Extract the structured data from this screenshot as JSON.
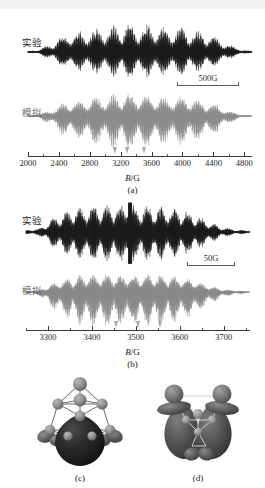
{
  "figure": {
    "type": "scientific-figure"
  },
  "panel_a": {
    "tag": "(a)",
    "axis_title_symbol": "B",
    "axis_title_unit": "/G",
    "traces": [
      {
        "key": "experiment",
        "label": "实验",
        "color": "#1c1c1c"
      },
      {
        "key": "simulation",
        "label": "模拟",
        "color": "#8a8a8a"
      }
    ],
    "scalebar": {
      "label": "500G"
    },
    "axis": {
      "min": 2000,
      "max": 4900,
      "ticks": [
        2000,
        2400,
        2800,
        3200,
        3600,
        4000,
        4400,
        4800
      ],
      "tick_labels": [
        "2000",
        "2400",
        "2800",
        "3200",
        "3600",
        "4000",
        "4400",
        "4800"
      ],
      "minor_step": 200
    },
    "markers": [
      3120,
      3280,
      3500
    ]
  },
  "panel_b": {
    "tag": "(b)",
    "axis_title_symbol": "B",
    "axis_title_unit": "/G",
    "traces": [
      {
        "key": "experiment",
        "label": "实验",
        "color": "#1c1c1c"
      },
      {
        "key": "simulation",
        "label": "模拟",
        "color": "#8a8a8a"
      }
    ],
    "scalebar": {
      "label": "50G"
    },
    "axis": {
      "min": 3250,
      "max": 3760,
      "ticks": [
        3300,
        3400,
        3500,
        3600,
        3700
      ],
      "tick_labels": [
        "3300",
        "3400",
        "3500",
        "3600",
        "3700"
      ],
      "minor_step": 50
    },
    "markers": [
      3455,
      3505,
      3555
    ]
  },
  "panel_c": {
    "tag": "(c)",
    "caption_note": "molecular orbital isosurface"
  },
  "panel_d": {
    "tag": "(d)",
    "caption_note": "molecular orbital isosurface"
  },
  "chart_data": {
    "type": "line",
    "title": "",
    "xlabel": "B/G",
    "ylabel": "",
    "charts": [
      {
        "name": "panel_a",
        "xlim": [
          2000,
          4900
        ],
        "xticks": [
          2000,
          2400,
          2800,
          3200,
          3600,
          4000,
          4400,
          4800
        ],
        "series": [
          {
            "name": "实验",
            "comment": "experimental EPR derivative spectrum, dense hyperfine envelope",
            "envelope_x": [
              2000,
              2150,
              2300,
              2420,
              2560,
              2700,
              2840,
              2980,
              3120,
              3250,
              3400,
              3520,
              3660,
              3800,
              3940,
              4080,
              4220,
              4360,
              4500,
              4640,
              4780,
              4900
            ],
            "envelope_y": [
              0.04,
              0.1,
              0.3,
              0.56,
              0.7,
              0.74,
              0.82,
              0.88,
              0.96,
              1.0,
              0.92,
              0.96,
              0.88,
              0.84,
              0.9,
              0.8,
              0.72,
              0.62,
              0.44,
              0.22,
              0.08,
              0.03
            ]
          },
          {
            "name": "模拟",
            "comment": "simulated EPR derivative spectrum",
            "envelope_x": [
              2000,
              2150,
              2300,
              2420,
              2560,
              2700,
              2840,
              2980,
              3120,
              3250,
              3400,
              3520,
              3660,
              3800,
              3940,
              4080,
              4220,
              4360,
              4500,
              4640,
              4780,
              4900
            ],
            "envelope_y": [
              0.03,
              0.08,
              0.26,
              0.52,
              0.66,
              0.7,
              0.78,
              0.84,
              0.92,
              0.98,
              0.88,
              0.94,
              0.84,
              0.8,
              0.86,
              0.76,
              0.68,
              0.56,
              0.4,
              0.18,
              0.06,
              0.02
            ]
          }
        ]
      },
      {
        "name": "panel_b",
        "xlim": [
          3250,
          3760
        ],
        "xticks": [
          3300,
          3400,
          3500,
          3600,
          3700
        ],
        "series": [
          {
            "name": "实验",
            "comment": "experimental EPR derivative spectrum, resolved hyperfine lines with central sharp feature",
            "envelope_x": [
              3250,
              3280,
              3310,
              3340,
              3370,
              3400,
              3430,
              3460,
              3480,
              3500,
              3520,
              3550,
              3580,
              3610,
              3640,
              3670,
              3700,
              3730,
              3760
            ],
            "envelope_y": [
              0.06,
              0.12,
              0.46,
              0.74,
              0.86,
              0.92,
              0.96,
              0.9,
              1.0,
              0.88,
              0.94,
              0.9,
              0.86,
              0.78,
              0.58,
              0.34,
              0.16,
              0.08,
              0.04
            ]
          },
          {
            "name": "模拟",
            "comment": "simulated EPR derivative spectrum",
            "envelope_x": [
              3250,
              3280,
              3310,
              3340,
              3370,
              3400,
              3430,
              3460,
              3480,
              3500,
              3520,
              3550,
              3580,
              3610,
              3640,
              3670,
              3700,
              3730,
              3760
            ],
            "envelope_y": [
              0.05,
              0.1,
              0.42,
              0.7,
              0.82,
              0.88,
              0.92,
              0.86,
              0.9,
              0.84,
              0.9,
              0.86,
              0.82,
              0.74,
              0.54,
              0.3,
              0.14,
              0.06,
              0.03
            ]
          }
        ]
      }
    ]
  }
}
